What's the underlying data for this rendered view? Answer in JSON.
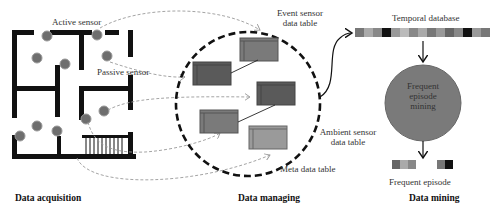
{
  "sections": {
    "acquisition": {
      "title": "Data acquisition"
    },
    "managing": {
      "title": "Data managing"
    },
    "mining": {
      "title": "Data mining"
    }
  },
  "labels": {
    "active_sensor": "Active sensor",
    "passive_sensor": "Passive sensor",
    "event_table": "Event sensor data table",
    "event_table_l1": "Event sensor",
    "event_table_l2": "data table",
    "ambient_table_l1": "Ambient sensor",
    "ambient_table_l2": "data table",
    "meta_table": "Meta data table",
    "temporal_db": "Temporal database",
    "fem_l1": "Frequent",
    "fem_l2": "episode",
    "fem_l3": "mining",
    "frequent_episode": "Frequent episode"
  },
  "colors": {
    "wall": "#111111",
    "sensor": "#6e6e6e",
    "table_dark": "#555555",
    "table_mid": "#7a7a7a",
    "table_light": "#9a9a9a",
    "fem_circle": "#7a7a7a",
    "dashed_link": "#999999"
  },
  "temporal_db_cells": [
    "#777",
    "#aaa",
    "#888",
    "#111",
    "#999",
    "#bbb",
    "#888",
    "#aaa",
    "#777",
    "#999",
    "#666",
    "#888",
    "#111",
    "#999",
    "#777"
  ],
  "frequent_episode_blocks": [
    [
      "#666",
      "#aaa",
      "#888"
    ],
    [
      "#777",
      "#111"
    ]
  ]
}
